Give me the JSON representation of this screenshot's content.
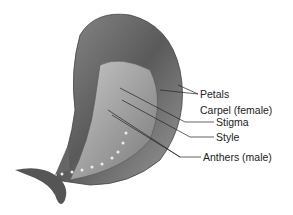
{
  "diagram": {
    "labels": [
      {
        "id": "petals",
        "text": "Petals",
        "x": 200,
        "y": 18
      },
      {
        "id": "carpel",
        "text": "Carpel (female)",
        "x": 200,
        "y": 34
      },
      {
        "id": "stigma",
        "text": "Stigma",
        "x": 216,
        "y": 120
      },
      {
        "id": "style",
        "text": "Style",
        "x": 216,
        "y": 135
      },
      {
        "id": "anthers",
        "text": "Anthers (male)",
        "x": 203,
        "y": 155
      }
    ]
  }
}
